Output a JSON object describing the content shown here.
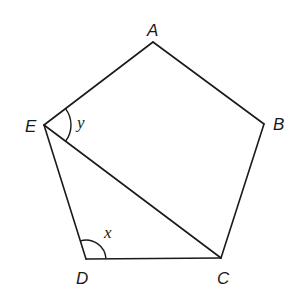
{
  "diagram": {
    "type": "geometry",
    "shape": "regular pentagon ABCDE with diagonal EC",
    "vertices": {
      "A": {
        "label": "A",
        "x": 153,
        "y": 42
      },
      "B": {
        "label": "B",
        "x": 264,
        "y": 124
      },
      "C": {
        "label": "C",
        "x": 221,
        "y": 258
      },
      "D": {
        "label": "D",
        "x": 86,
        "y": 259
      },
      "E": {
        "label": "E",
        "x": 44,
        "y": 125
      }
    },
    "edges": [
      "AB",
      "BC",
      "CD",
      "DE",
      "EA",
      "EC"
    ],
    "angles": [
      {
        "label": "y",
        "vertex": "E",
        "between": [
          "EA",
          "EC"
        ]
      },
      {
        "label": "x",
        "vertex": "D",
        "between": [
          "DE",
          "DC"
        ]
      }
    ],
    "line_color": "#1a1a1a",
    "background": "#ffffff"
  }
}
